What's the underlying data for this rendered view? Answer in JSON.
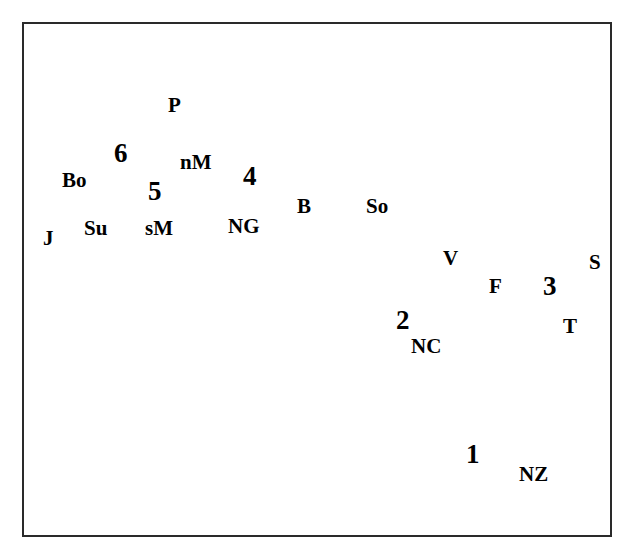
{
  "figure": {
    "type": "line-drawing map",
    "background_color": "#ffffff",
    "ink_color": "#000000",
    "frame_color": "#2a2a2a",
    "frame": {
      "x": 22,
      "y": 22,
      "width": 590,
      "height": 515
    }
  },
  "labels": [
    {
      "id": "P",
      "text": "P",
      "x": 168,
      "y": 95,
      "kind": "letter",
      "meaning": "Philippines"
    },
    {
      "id": "6",
      "text": "6",
      "x": 114,
      "y": 140,
      "kind": "number",
      "meaning": "region 6"
    },
    {
      "id": "Bo",
      "text": "Bo",
      "x": 62,
      "y": 170,
      "kind": "letter",
      "meaning": "Borneo"
    },
    {
      "id": "nM",
      "text": "nM",
      "x": 180,
      "y": 152,
      "kind": "letter",
      "meaning": "northern Moluccas"
    },
    {
      "id": "5",
      "text": "5",
      "x": 148,
      "y": 178,
      "kind": "number",
      "meaning": "region 5"
    },
    {
      "id": "4",
      "text": "4",
      "x": 243,
      "y": 163,
      "kind": "number",
      "meaning": "region 4"
    },
    {
      "id": "Su",
      "text": "Su",
      "x": 84,
      "y": 218,
      "kind": "letter",
      "meaning": "Sulawesi"
    },
    {
      "id": "sM",
      "text": "sM",
      "x": 145,
      "y": 218,
      "kind": "letter",
      "meaning": "southern Moluccas"
    },
    {
      "id": "J",
      "text": "J",
      "x": 43,
      "y": 228,
      "kind": "letter",
      "meaning": "Java"
    },
    {
      "id": "NG",
      "text": "NG",
      "x": 228,
      "y": 216,
      "kind": "letter",
      "meaning": "New Guinea"
    },
    {
      "id": "B",
      "text": "B",
      "x": 297,
      "y": 196,
      "kind": "letter",
      "meaning": "Bismarck Archipelago"
    },
    {
      "id": "So",
      "text": "So",
      "x": 366,
      "y": 196,
      "kind": "letter",
      "meaning": "Solomon Islands"
    },
    {
      "id": "V",
      "text": "V",
      "x": 443,
      "y": 248,
      "kind": "letter",
      "meaning": "Vanuatu"
    },
    {
      "id": "F",
      "text": "F",
      "x": 489,
      "y": 276,
      "kind": "letter",
      "meaning": "Fiji"
    },
    {
      "id": "3",
      "text": "3",
      "x": 543,
      "y": 273,
      "kind": "number",
      "meaning": "region 3"
    },
    {
      "id": "S",
      "text": "S",
      "x": 589,
      "y": 252,
      "kind": "letter",
      "meaning": "Samoa"
    },
    {
      "id": "T",
      "text": "T",
      "x": 563,
      "y": 316,
      "kind": "letter",
      "meaning": "Tonga"
    },
    {
      "id": "2",
      "text": "2",
      "x": 396,
      "y": 307,
      "kind": "number",
      "meaning": "region 2"
    },
    {
      "id": "NC",
      "text": "NC",
      "x": 411,
      "y": 336,
      "kind": "letter",
      "meaning": "New Caledonia"
    },
    {
      "id": "1",
      "text": "1",
      "x": 466,
      "y": 441,
      "kind": "number",
      "meaning": "region 1"
    },
    {
      "id": "NZ",
      "text": "NZ",
      "x": 519,
      "y": 464,
      "kind": "letter",
      "meaning": "New Zealand"
    }
  ],
  "legend_note": "Hatched / shaded outlines mark island groups; stippled band marks the continental shelf around Australia and New Guinea."
}
